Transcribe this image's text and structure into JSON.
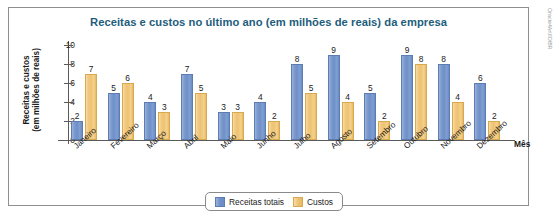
{
  "credit": "Oracle4Art/ID/BR",
  "chart_data": {
    "type": "bar",
    "title": "Receitas e custos no último ano (em milhões de reais) da empresa",
    "xlabel": "Mês",
    "ylabel": "Receitas e custos\n(em milhões de reais)",
    "ylabel_line1": "Receitas e custos",
    "ylabel_line2": "(em milhões de reais)",
    "categories": [
      "Janeiro",
      "Fevereiro",
      "Março",
      "Abril",
      "Maio",
      "Junho",
      "Julho",
      "Agosto",
      "Setembro",
      "Outubro",
      "Novembro",
      "Dezembro"
    ],
    "series": [
      {
        "name": "Receitas totais",
        "color": "#6e8fc9",
        "values": [
          2,
          5,
          4,
          7,
          3,
          4,
          8,
          9,
          5,
          9,
          8,
          6
        ]
      },
      {
        "name": "Custos",
        "color": "#eec273",
        "values": [
          7,
          6,
          3,
          5,
          3,
          2,
          5,
          4,
          2,
          8,
          4,
          2
        ]
      }
    ],
    "ylim": [
      0,
      10
    ],
    "yticks": [
      0,
      2,
      4,
      6,
      8,
      10
    ],
    "grid": false,
    "legend_position": "bottom",
    "title_color": "#1d5d7d"
  }
}
